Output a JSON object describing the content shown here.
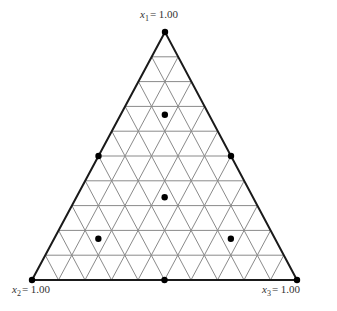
{
  "diagram": {
    "type": "ternary simplex design",
    "grid_divisions": 10,
    "colors": {
      "background": "#ffffff",
      "grid": "#8a8a8a",
      "border": "#1a1a1a",
      "points": "#000000",
      "labels": "#333333"
    },
    "vertices": [
      {
        "id": "top",
        "var": "x",
        "sub": "1",
        "value_text": "= 1.00"
      },
      {
        "id": "bottom-left",
        "var": "x",
        "sub": "2",
        "value_text": "= 1.00"
      },
      {
        "id": "bottom-right",
        "var": "x",
        "sub": "3",
        "value_text": "= 1.00"
      }
    ],
    "design_points": [
      {
        "x1": 1.0,
        "x2": 0.0,
        "x3": 0.0
      },
      {
        "x1": 0.0,
        "x2": 1.0,
        "x3": 0.0
      },
      {
        "x1": 0.0,
        "x2": 0.0,
        "x3": 1.0
      },
      {
        "x1": 0.5,
        "x2": 0.5,
        "x3": 0.0
      },
      {
        "x1": 0.5,
        "x2": 0.0,
        "x3": 0.5
      },
      {
        "x1": 0.0,
        "x2": 0.5,
        "x3": 0.5
      },
      {
        "x1": 0.3333,
        "x2": 0.3333,
        "x3": 0.3333
      },
      {
        "x1": 0.6667,
        "x2": 0.1667,
        "x3": 0.1667
      },
      {
        "x1": 0.1667,
        "x2": 0.6667,
        "x3": 0.1667
      },
      {
        "x1": 0.1667,
        "x2": 0.1667,
        "x3": 0.6667
      }
    ]
  }
}
